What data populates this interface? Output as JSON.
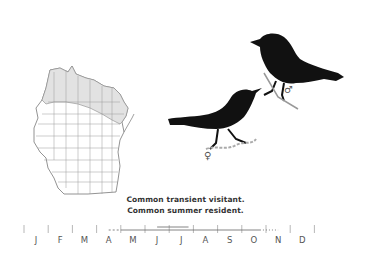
{
  "species_plate": {
    "status_lines": [
      "Common transient visitant.",
      "Common summer resident."
    ],
    "symbols": {
      "male": "♂",
      "female": "♀"
    },
    "map": {
      "region": "Wisconsin",
      "shaded_area": "northern counties (breeding range)",
      "shade_color": "#e2e2e2",
      "line_color": "#8a8a8a"
    },
    "birds": {
      "silhouette_color": "#111111",
      "figures": [
        "male",
        "female"
      ]
    }
  },
  "chart_data": {
    "type": "line",
    "title": "",
    "categories": [
      "J",
      "F",
      "M",
      "A",
      "M",
      "J",
      "J",
      "A",
      "S",
      "O",
      "N",
      "D"
    ],
    "xlabel": "",
    "ylabel": "",
    "series": [
      {
        "name": "occurrence (sparse, early)",
        "style": "dashed",
        "start_month": 3.5,
        "end_month": 4.0
      },
      {
        "name": "common presence",
        "style": "solid",
        "start_month": 4.0,
        "end_month": 9.75
      },
      {
        "name": "breeding peak",
        "style": "solid-double",
        "start_month": 5.5,
        "end_month": 6.8
      },
      {
        "name": "occurrence (sparse, late)",
        "style": "dotted",
        "start_month": 9.75,
        "end_month": 10.5
      }
    ]
  }
}
